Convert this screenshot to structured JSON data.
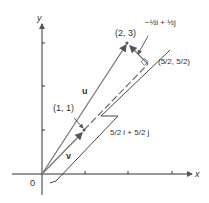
{
  "axes": {
    "x_label": "x",
    "y_label": "y",
    "origin_label": "0"
  },
  "points": {
    "p23": "(2, 3)",
    "p11": "(1, 1)",
    "p52": "(5/2, 5/2)"
  },
  "vectors": {
    "u": "u",
    "v": "v"
  },
  "annotations": {
    "perp": "−½i + ½j",
    "proj": "5/2 i + 5/2 j"
  }
}
